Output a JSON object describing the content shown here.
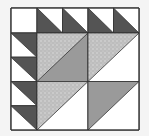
{
  "diagram": {
    "name": "quilt-block-pattern",
    "colors": {
      "background": "#f4f4f4",
      "white": "#ffffff",
      "dark": "#545454",
      "medium": "#9a9a9a",
      "light_print": "#bdbdbd",
      "print_dot": "#e2e2e2",
      "outline": "#333333"
    },
    "block": {
      "x": 11,
      "y": 8,
      "width": 128,
      "height": 122
    }
  }
}
